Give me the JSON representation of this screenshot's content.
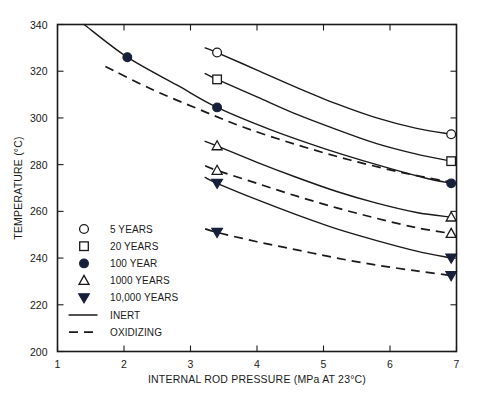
{
  "chart_data": {
    "type": "line",
    "title": "",
    "xlabel": "INTERNAL ROD PRESSURE (MPa AT 23°C)",
    "ylabel": "TEMPERATURE (°C)",
    "xlim": [
      1,
      7
    ],
    "ylim": [
      200,
      340
    ],
    "xticks": [
      1,
      2,
      3,
      4,
      5,
      6,
      7
    ],
    "yticks": [
      200,
      220,
      240,
      260,
      280,
      300,
      320,
      340
    ],
    "grid": false,
    "legend_position": "lower-left-inside",
    "legend": [
      {
        "label": "5 YEARS",
        "marker": "open-circle"
      },
      {
        "label": "20 YEARS",
        "marker": "open-square"
      },
      {
        "label": "100 YEAR",
        "marker": "filled-circle"
      },
      {
        "label": "1000 YEARS",
        "marker": "open-triangle-up"
      },
      {
        "label": "10,000 YEARS",
        "marker": "filled-triangle-down"
      },
      {
        "label": "INERT",
        "marker": "solid-line"
      },
      {
        "label": "OXIDIZING",
        "marker": "dashed-line"
      }
    ],
    "series": [
      {
        "name": "5 YEARS INERT",
        "environment": "INERT",
        "marker": "open-circle",
        "style": "solid",
        "points": [
          {
            "x": 3.22,
            "y": 330.0
          },
          {
            "x": 3.4,
            "y": 328.0
          },
          {
            "x": 4.0,
            "y": 320.5
          },
          {
            "x": 4.6,
            "y": 313.0
          },
          {
            "x": 5.2,
            "y": 306.0
          },
          {
            "x": 5.8,
            "y": 300.0
          },
          {
            "x": 6.4,
            "y": 295.5
          },
          {
            "x": 6.92,
            "y": 293.0
          }
        ],
        "markers_at": [
          {
            "x": 3.4,
            "y": 328.0
          },
          {
            "x": 6.92,
            "y": 293.0
          }
        ]
      },
      {
        "name": "20 YEARS INERT",
        "environment": "INERT",
        "marker": "open-square",
        "style": "solid",
        "points": [
          {
            "x": 3.22,
            "y": 319.0
          },
          {
            "x": 3.4,
            "y": 316.5
          },
          {
            "x": 4.0,
            "y": 309.0
          },
          {
            "x": 4.6,
            "y": 301.5
          },
          {
            "x": 5.2,
            "y": 295.0
          },
          {
            "x": 5.8,
            "y": 289.0
          },
          {
            "x": 6.4,
            "y": 284.5
          },
          {
            "x": 6.92,
            "y": 281.5
          }
        ],
        "markers_at": [
          {
            "x": 3.4,
            "y": 316.5
          },
          {
            "x": 6.92,
            "y": 281.5
          }
        ]
      },
      {
        "name": "100 YEAR INERT",
        "environment": "INERT",
        "marker": "filled-circle",
        "style": "solid",
        "points": [
          {
            "x": 1.4,
            "y": 340.0
          },
          {
            "x": 2.05,
            "y": 326.0
          },
          {
            "x": 2.8,
            "y": 314.0
          },
          {
            "x": 3.4,
            "y": 304.5
          },
          {
            "x": 4.2,
            "y": 295.0
          },
          {
            "x": 5.0,
            "y": 287.0
          },
          {
            "x": 5.8,
            "y": 280.0
          },
          {
            "x": 6.5,
            "y": 274.5
          },
          {
            "x": 6.92,
            "y": 272.0
          }
        ],
        "markers_at": [
          {
            "x": 2.05,
            "y": 326.0
          },
          {
            "x": 3.4,
            "y": 304.5
          },
          {
            "x": 6.92,
            "y": 272.0
          }
        ]
      },
      {
        "name": "100 YEAR OXIDIZING",
        "environment": "OXIDIZING",
        "marker": "none",
        "style": "dashed",
        "points": [
          {
            "x": 1.72,
            "y": 322.0
          },
          {
            "x": 2.4,
            "y": 312.5
          },
          {
            "x": 3.1,
            "y": 304.0
          },
          {
            "x": 3.8,
            "y": 296.0
          },
          {
            "x": 4.6,
            "y": 288.5
          },
          {
            "x": 5.4,
            "y": 282.0
          },
          {
            "x": 6.2,
            "y": 276.5
          },
          {
            "x": 6.92,
            "y": 272.5
          }
        ],
        "markers_at": []
      },
      {
        "name": "1000 YEARS INERT",
        "environment": "INERT",
        "marker": "open-triangle-up",
        "style": "solid",
        "points": [
          {
            "x": 3.22,
            "y": 290.0
          },
          {
            "x": 3.4,
            "y": 288.0
          },
          {
            "x": 4.0,
            "y": 281.0
          },
          {
            "x": 4.6,
            "y": 274.5
          },
          {
            "x": 5.2,
            "y": 268.5
          },
          {
            "x": 5.8,
            "y": 263.5
          },
          {
            "x": 6.4,
            "y": 259.5
          },
          {
            "x": 6.92,
            "y": 257.5
          }
        ],
        "markers_at": [
          {
            "x": 3.4,
            "y": 288.0
          },
          {
            "x": 6.92,
            "y": 257.5
          }
        ]
      },
      {
        "name": "1000 YEARS OXIDIZING",
        "environment": "OXIDIZING",
        "marker": "open-triangle-up",
        "style": "dashed",
        "points": [
          {
            "x": 3.22,
            "y": 279.5
          },
          {
            "x": 3.4,
            "y": 277.5
          },
          {
            "x": 4.0,
            "y": 272.0
          },
          {
            "x": 4.6,
            "y": 266.5
          },
          {
            "x": 5.2,
            "y": 261.5
          },
          {
            "x": 5.8,
            "y": 257.0
          },
          {
            "x": 6.4,
            "y": 253.0
          },
          {
            "x": 6.92,
            "y": 250.5
          }
        ],
        "markers_at": [
          {
            "x": 3.4,
            "y": 277.5
          },
          {
            "x": 6.92,
            "y": 250.5
          }
        ]
      },
      {
        "name": "10,000 YEARS INERT",
        "environment": "INERT",
        "marker": "filled-triangle-down",
        "style": "solid",
        "points": [
          {
            "x": 3.22,
            "y": 274.5
          },
          {
            "x": 3.4,
            "y": 272.0
          },
          {
            "x": 4.0,
            "y": 265.0
          },
          {
            "x": 4.6,
            "y": 258.5
          },
          {
            "x": 5.2,
            "y": 252.5
          },
          {
            "x": 5.8,
            "y": 247.5
          },
          {
            "x": 6.4,
            "y": 243.0
          },
          {
            "x": 6.92,
            "y": 240.0
          }
        ],
        "markers_at": [
          {
            "x": 3.4,
            "y": 272.0
          },
          {
            "x": 6.92,
            "y": 240.0
          }
        ]
      },
      {
        "name": "10,000 YEARS OXIDIZING",
        "environment": "OXIDIZING",
        "marker": "filled-triangle-down",
        "style": "dashed",
        "points": [
          {
            "x": 3.22,
            "y": 252.5
          },
          {
            "x": 3.4,
            "y": 251.0
          },
          {
            "x": 4.0,
            "y": 247.0
          },
          {
            "x": 4.6,
            "y": 243.5
          },
          {
            "x": 5.2,
            "y": 240.0
          },
          {
            "x": 5.8,
            "y": 237.0
          },
          {
            "x": 6.4,
            "y": 234.5
          },
          {
            "x": 6.92,
            "y": 232.5
          }
        ],
        "markers_at": [
          {
            "x": 3.4,
            "y": 251.0
          },
          {
            "x": 6.92,
            "y": 232.5
          }
        ]
      }
    ]
  },
  "colors": {
    "axis": "#1a1a1a",
    "curve": "#1a1a1a",
    "marker_fill": "#16203a",
    "background": "#ffffff"
  }
}
